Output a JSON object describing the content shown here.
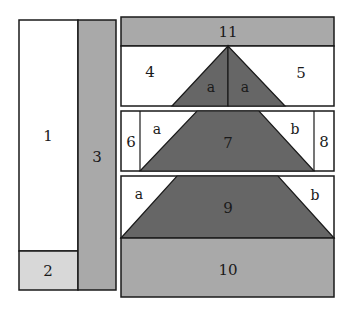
{
  "colors": {
    "white": "#ffffff",
    "light_gray": "#d8d8d8",
    "medium_gray": "#a9a9a9",
    "dark_gray": "#666666",
    "outline": "#1a1a1a"
  },
  "pieces": {
    "p1": "1",
    "p2": "2",
    "p3": "3",
    "p4": "4",
    "p5": "5",
    "p6": "6",
    "p7": "7",
    "p8": "8",
    "p9": "9",
    "p10": "10",
    "p11": "11"
  },
  "sub_labels": {
    "row45_left": "a",
    "row45_right": "a",
    "row678_left": "a",
    "row678_right": "b",
    "row910_left": "a",
    "row910_right": "b"
  }
}
